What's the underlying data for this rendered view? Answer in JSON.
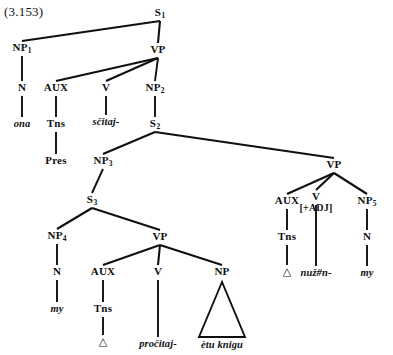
{
  "figure": {
    "example_number": "(3.153)",
    "type": "syntactic-tree-diagram",
    "ink_color": "#101010",
    "background_color": "#ffffff"
  },
  "nodes": {
    "s1": {
      "label": "S",
      "sub": "1",
      "x": 160,
      "y": 13
    },
    "np1": {
      "label": "NP",
      "sub": "1",
      "x": 22,
      "y": 48
    },
    "vp1": {
      "label": "VP",
      "sub": "",
      "x": 158,
      "y": 50
    },
    "n1": {
      "label": "N",
      "sub": "",
      "x": 22,
      "y": 88
    },
    "aux1": {
      "label": "AUX",
      "sub": "",
      "x": 56,
      "y": 88
    },
    "v1": {
      "label": "V",
      "sub": "",
      "x": 106,
      "y": 88
    },
    "np2": {
      "label": "NP",
      "sub": "2",
      "x": 155,
      "y": 88
    },
    "ona": {
      "label": "ona",
      "sub": "",
      "x": 22,
      "y": 124
    },
    "tns1": {
      "label": "Tns",
      "sub": "",
      "x": 56,
      "y": 124
    },
    "scitaj": {
      "label": "sčitaj-",
      "sub": "",
      "x": 106,
      "y": 122
    },
    "s2": {
      "label": "S",
      "sub": "2",
      "x": 155,
      "y": 124
    },
    "pres": {
      "label": "Pres",
      "sub": "",
      "x": 56,
      "y": 161
    },
    "np3": {
      "label": "NP",
      "sub": "3",
      "x": 103,
      "y": 161
    },
    "vp2": {
      "label": "VP",
      "sub": "",
      "x": 334,
      "y": 165
    },
    "s3": {
      "label": "S",
      "sub": "3",
      "x": 92,
      "y": 200
    },
    "aux2": {
      "label": "AUX",
      "sub": "",
      "x": 287,
      "y": 201
    },
    "v2": {
      "label": "V",
      "sub": "",
      "x": 316,
      "y": 197
    },
    "v2_feat": {
      "label": "[+ADJ]",
      "sub": "",
      "x": 316,
      "y": 208
    },
    "np5": {
      "label": "NP",
      "sub": "5",
      "x": 367,
      "y": 201
    },
    "np4": {
      "label": "NP",
      "sub": "4",
      "x": 57,
      "y": 236
    },
    "vp3": {
      "label": "VP",
      "sub": "",
      "x": 160,
      "y": 237
    },
    "tns2": {
      "label": "Tns",
      "sub": "",
      "x": 287,
      "y": 237
    },
    "n3": {
      "label": "N",
      "sub": "",
      "x": 367,
      "y": 237
    },
    "n2": {
      "label": "N",
      "sub": "",
      "x": 57,
      "y": 272
    },
    "aux3": {
      "label": "AUX",
      "sub": "",
      "x": 103,
      "y": 272
    },
    "v3": {
      "label": "V",
      "sub": "",
      "x": 158,
      "y": 272
    },
    "np6": {
      "label": "NP",
      "sub": "",
      "x": 222,
      "y": 272
    },
    "delta2": {
      "label": "△",
      "sub": "",
      "x": 287,
      "y": 272
    },
    "nuzn": {
      "label": "nuž#n-",
      "sub": "",
      "x": 316,
      "y": 273
    },
    "my2": {
      "label": "my",
      "sub": "",
      "x": 367,
      "y": 273
    },
    "my1": {
      "label": "my",
      "sub": "",
      "x": 57,
      "y": 309
    },
    "tns3": {
      "label": "Tns",
      "sub": "",
      "x": 103,
      "y": 309
    },
    "delta1": {
      "label": "△",
      "sub": "",
      "x": 103,
      "y": 342
    },
    "procitaj": {
      "label": "pročitaj-",
      "sub": "",
      "x": 158,
      "y": 344
    },
    "etuknigu": {
      "label": "ètu knigu",
      "sub": "",
      "x": 222,
      "y": 345
    }
  },
  "edges": [
    {
      "from": "s1",
      "to": "np1",
      "kind": "branch"
    },
    {
      "from": "s1",
      "to": "vp1",
      "kind": "branch"
    },
    {
      "from": "np1",
      "to": "n1",
      "kind": "stem"
    },
    {
      "from": "vp1",
      "to": "aux1",
      "kind": "branch"
    },
    {
      "from": "vp1",
      "to": "v1",
      "kind": "branch"
    },
    {
      "from": "vp1",
      "to": "np2",
      "kind": "stem"
    },
    {
      "from": "n1",
      "to": "ona",
      "kind": "stem"
    },
    {
      "from": "aux1",
      "to": "tns1",
      "kind": "stem"
    },
    {
      "from": "v1",
      "to": "scitaj",
      "kind": "stem"
    },
    {
      "from": "np2",
      "to": "s2",
      "kind": "stem"
    },
    {
      "from": "tns1",
      "to": "pres",
      "kind": "stem"
    },
    {
      "from": "s2",
      "to": "np3",
      "kind": "branch"
    },
    {
      "from": "s2",
      "to": "vp2",
      "kind": "branch"
    },
    {
      "from": "np3",
      "to": "s3",
      "kind": "stem"
    },
    {
      "from": "s3",
      "to": "np4",
      "kind": "branch"
    },
    {
      "from": "s3",
      "to": "vp3",
      "kind": "branch"
    },
    {
      "from": "vp2",
      "to": "aux2",
      "kind": "branch"
    },
    {
      "from": "vp2",
      "to": "v2",
      "kind": "branch"
    },
    {
      "from": "vp2",
      "to": "np5",
      "kind": "branch"
    },
    {
      "from": "np4",
      "to": "n2",
      "kind": "stem"
    },
    {
      "from": "vp3",
      "to": "aux3",
      "kind": "branch"
    },
    {
      "from": "vp3",
      "to": "v3",
      "kind": "branch"
    },
    {
      "from": "vp3",
      "to": "np6",
      "kind": "branch"
    },
    {
      "from": "aux2",
      "to": "tns2",
      "kind": "stem"
    },
    {
      "from": "np5",
      "to": "n3",
      "kind": "stem"
    },
    {
      "from": "n2",
      "to": "my1",
      "kind": "stem"
    },
    {
      "from": "aux3",
      "to": "tns3",
      "kind": "stem"
    },
    {
      "from": "v3",
      "to": "procitaj",
      "kind": "stem"
    },
    {
      "from": "tns2",
      "to": "delta2",
      "kind": "stem"
    },
    {
      "from": "v2",
      "to": "nuzn",
      "kind": "stem"
    },
    {
      "from": "n3",
      "to": "my2",
      "kind": "stem"
    },
    {
      "from": "tns3",
      "to": "delta1",
      "kind": "stem"
    }
  ],
  "triangles": [
    {
      "name": "np-etu-knigu-triangle",
      "apex_x": 222,
      "apex_y": 282,
      "left_x": 199,
      "right_x": 245,
      "base_y": 337
    }
  ]
}
